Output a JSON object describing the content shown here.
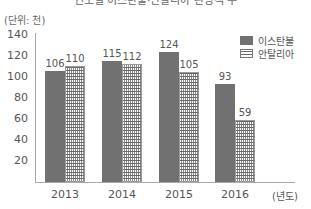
{
  "chart_data": {
    "type": "bar",
    "title": "연도별 이스탄불·안탈리아 관광객 수",
    "unit_label": "(단위: 천)",
    "xlabel": "(년도)",
    "ylabel": "",
    "categories": [
      "2013",
      "2014",
      "2015",
      "2016"
    ],
    "series": [
      {
        "name": "이스탄불",
        "values": [
          106,
          115,
          124,
          93
        ],
        "color": "#717171",
        "pattern": "solid"
      },
      {
        "name": "안탈리아",
        "values": [
          110,
          112,
          105,
          59
        ],
        "color": "#ffffff",
        "pattern": "hatched"
      }
    ],
    "yticks": [
      20,
      40,
      60,
      80,
      100,
      120,
      140
    ],
    "ylim": [
      0,
      140
    ],
    "grid": false,
    "legend_position": "top-right"
  }
}
